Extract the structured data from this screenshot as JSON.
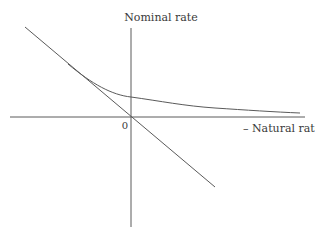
{
  "diagram": {
    "y_axis_label": "Nominal rate",
    "x_axis_label": "– Natural rate",
    "origin_label": "0",
    "colors": {
      "line": "#5a5a5a",
      "text": "#3a3a3a",
      "background": "#ffffff"
    },
    "elements": [
      {
        "type": "axis",
        "name": "horizontal-axis"
      },
      {
        "type": "axis",
        "name": "vertical-axis"
      },
      {
        "type": "line",
        "name": "straight-diagonal-line",
        "description": "downward sloping line through origin"
      },
      {
        "type": "curve",
        "name": "convex-curve",
        "description": "curve tangent to diagonal line, crossing vertical axis above origin and flattening toward horizontal axis"
      }
    ]
  }
}
